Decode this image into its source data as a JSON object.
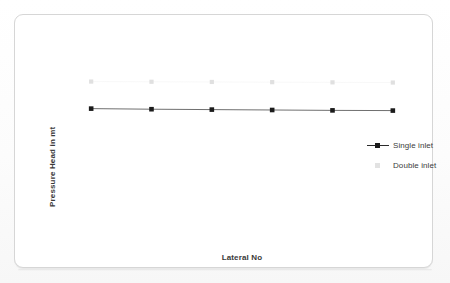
{
  "chart_data": {
    "type": "line",
    "title": "",
    "subtitle": "",
    "xlabel": "Lateral No",
    "ylabel": "Pressure Head in mt",
    "x": [
      1,
      2,
      3,
      4,
      5,
      6
    ],
    "categories": [
      "1",
      "2",
      "3",
      "4",
      "5",
      "6"
    ],
    "xticklabels": [],
    "yticklabels": [],
    "xlim": [
      0.5,
      6.5
    ],
    "ylim": [
      0,
      10
    ],
    "grid": false,
    "axis_lines_visible": false,
    "legend_position": "right-middle",
    "series": [
      {
        "name": "Single inlet",
        "marker": "square",
        "marker_color": "#1b1b1b",
        "line_color": "#4a4a4a",
        "line_visible": true,
        "values": [
          6.55,
          6.52,
          6.5,
          6.48,
          6.46,
          6.45
        ]
      },
      {
        "name": "Double inlet",
        "marker": "square",
        "marker_color": "#e0e0e0",
        "line_color": "#f2f2f2",
        "line_visible": false,
        "values": [
          7.93,
          7.92,
          7.91,
          7.9,
          7.89,
          7.88
        ]
      }
    ],
    "annotations": []
  },
  "axes": {
    "y_title": "Pressure Head in mt",
    "x_title": "Lateral No"
  },
  "legend": {
    "items": [
      {
        "label": "Single inlet",
        "key": "line-square-marker",
        "color": "#1b1b1b"
      },
      {
        "label": "Double inlet",
        "key": "square-marker",
        "color": "#e0e0e0"
      }
    ]
  },
  "colors": {
    "frame_border": "#d6d6d6",
    "plot_background": "#ffffff",
    "page_background": "#fdfdfd",
    "series_1": "#1b1b1b",
    "series_2": "#e0e0e0",
    "axis_title_text": "#3a3a3a",
    "legend_text": "#3c3c3c"
  }
}
